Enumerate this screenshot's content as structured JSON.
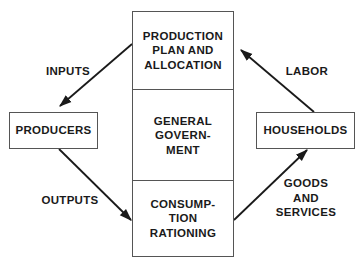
{
  "diagram": {
    "central_box": {
      "sections": [
        {
          "id": "production",
          "label": "PRODUCTION\nPLAN AND\nALLOCATION"
        },
        {
          "id": "government",
          "label": "GENERAL\nGOVERN-\nMENT"
        },
        {
          "id": "consumption",
          "label": "CONSUMP-\nTION\nRATIONING"
        }
      ]
    },
    "nodes": {
      "producers": "PRODUCERS",
      "households": "HOUSEHOLDS"
    },
    "edges": [
      {
        "id": "inputs",
        "label": "INPUTS",
        "from": "production",
        "to": "producers"
      },
      {
        "id": "outputs",
        "label": "OUTPUTS",
        "from": "producers",
        "to": "consumption"
      },
      {
        "id": "labor",
        "label": "LABOR",
        "from": "households",
        "to": "production"
      },
      {
        "id": "goods",
        "label": "GOODS\nAND\nSERVICES",
        "from": "consumption",
        "to": "households"
      }
    ],
    "colors": {
      "stroke": "#1a1a1a",
      "box_border": "#555555",
      "background": "#ffffff"
    }
  }
}
